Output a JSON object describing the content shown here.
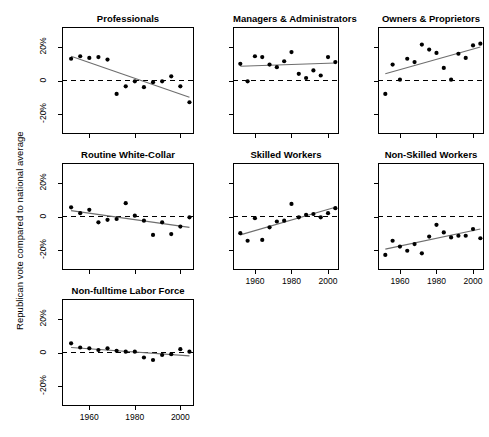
{
  "figure": {
    "ylabel": "Republican vote compared to national average",
    "y_ticks": [
      "20%",
      "0",
      "-20%"
    ],
    "y_tick_values": [
      20,
      0,
      -20
    ],
    "x_ticks": [
      "1960",
      "1980",
      "2000"
    ],
    "x_tick_values": [
      1960,
      1980,
      2000
    ],
    "colors": {
      "point": "#000000",
      "trend": "#6e6e6e",
      "zero_reference": "#000000",
      "frame": "#000000",
      "background": "#ffffff"
    }
  },
  "chart_data": {
    "type": "scatter",
    "title": "",
    "xlabel": "",
    "ylabel": "Republican vote compared to national average",
    "xlim": [
      1948,
      2006
    ],
    "ylim": [
      -32,
      32
    ],
    "grid": false,
    "legend": "none",
    "layout": {
      "rows": 3,
      "cols": 3,
      "panel_order": [
        "Professionals",
        "Managers & Administrators",
        "Owners & Proprietors",
        "Routine White-Collar",
        "Skilled Workers",
        "Non-Skilled Workers",
        "Non-fulltime Labor Force"
      ]
    },
    "annotations": [
      "dashed horizontal reference line at 0",
      "grey least-squares trend line per panel"
    ],
    "panels": [
      {
        "name": "Professionals",
        "row": 0,
        "col": 0,
        "x": [
          1952,
          1956,
          1960,
          1964,
          1968,
          1972,
          1976,
          1980,
          1984,
          1988,
          1992,
          1996,
          2000,
          2004
        ],
        "y": [
          13.0,
          14.5,
          13.5,
          14.0,
          12.5,
          -8.0,
          -3.5,
          -0.5,
          -4.0,
          -1.0,
          -0.5,
          2.5,
          -3.5,
          -13.0
        ],
        "trend": {
          "x": [
            1952,
            2004
          ],
          "y": [
            14.5,
            -10.0
          ]
        }
      },
      {
        "name": "Managers & Administrators",
        "row": 0,
        "col": 1,
        "x": [
          1952,
          1956,
          1960,
          1964,
          1968,
          1972,
          1976,
          1980,
          1984,
          1988,
          1992,
          1996,
          2000,
          2004
        ],
        "y": [
          10.0,
          -0.5,
          14.5,
          14.0,
          9.5,
          8.0,
          11.5,
          17.0,
          4.0,
          1.5,
          6.0,
          3.0,
          14.0,
          11.0
        ],
        "trend": {
          "x": [
            1952,
            2004
          ],
          "y": [
            8.5,
            10.5
          ]
        }
      },
      {
        "name": "Owners & Proprietors",
        "row": 0,
        "col": 2,
        "x": [
          1952,
          1956,
          1960,
          1964,
          1968,
          1972,
          1976,
          1980,
          1984,
          1988,
          1992,
          1996,
          2000,
          2004
        ],
        "y": [
          -8.0,
          9.5,
          0.5,
          13.0,
          11.0,
          21.5,
          18.5,
          16.5,
          7.5,
          0.5,
          16.0,
          13.5,
          21.0,
          22.0
        ],
        "trend": {
          "x": [
            1952,
            2004
          ],
          "y": [
            4.0,
            20.0
          ]
        }
      },
      {
        "name": "Routine White-Collar",
        "row": 1,
        "col": 0,
        "x": [
          1952,
          1956,
          1960,
          1964,
          1968,
          1972,
          1976,
          1980,
          1984,
          1988,
          1992,
          1996,
          2000,
          2004
        ],
        "y": [
          5.5,
          2.0,
          4.0,
          -3.5,
          -2.0,
          -1.5,
          8.0,
          0.5,
          -2.5,
          -11.0,
          -3.5,
          -10.5,
          -6.0,
          -0.5
        ],
        "trend": {
          "x": [
            1952,
            2004
          ],
          "y": [
            3.5,
            -6.5
          ]
        }
      },
      {
        "name": "Skilled Workers",
        "row": 1,
        "col": 1,
        "x": [
          1952,
          1956,
          1960,
          1964,
          1968,
          1972,
          1976,
          1980,
          1984,
          1988,
          1992,
          1996,
          2000,
          2004
        ],
        "y": [
          -10.0,
          -14.5,
          -1.0,
          -14.0,
          -6.5,
          -3.0,
          -2.5,
          7.5,
          -0.5,
          1.0,
          1.5,
          -0.5,
          2.0,
          5.0
        ],
        "trend": {
          "x": [
            1952,
            2004
          ],
          "y": [
            -11.0,
            5.5
          ]
        }
      },
      {
        "name": "Non-Skilled Workers",
        "row": 1,
        "col": 2,
        "x": [
          1952,
          1956,
          1960,
          1964,
          1968,
          1972,
          1976,
          1980,
          1984,
          1988,
          1992,
          1996,
          2000,
          2004
        ],
        "y": [
          -23.0,
          -14.5,
          -18.0,
          -20.5,
          -16.5,
          -22.0,
          -12.0,
          -5.0,
          -9.5,
          -12.5,
          -11.5,
          -11.5,
          -7.5,
          -13.0
        ],
        "trend": {
          "x": [
            1952,
            2004
          ],
          "y": [
            -19.5,
            -7.5
          ]
        }
      },
      {
        "name": "Non-fulltime Labor Force",
        "row": 2,
        "col": 0,
        "x": [
          1952,
          1956,
          1960,
          1964,
          1968,
          1972,
          1976,
          1980,
          1984,
          1988,
          1992,
          1996,
          2000,
          2004
        ],
        "y": [
          5.5,
          3.0,
          2.5,
          1.5,
          2.5,
          1.0,
          0.5,
          0.5,
          -3.0,
          -4.5,
          -1.5,
          -1.0,
          2.0,
          0.5,
          -1.0
        ],
        "trend": {
          "x": [
            1952,
            2004
          ],
          "y": [
            3.0,
            -2.0
          ]
        }
      }
    ]
  }
}
